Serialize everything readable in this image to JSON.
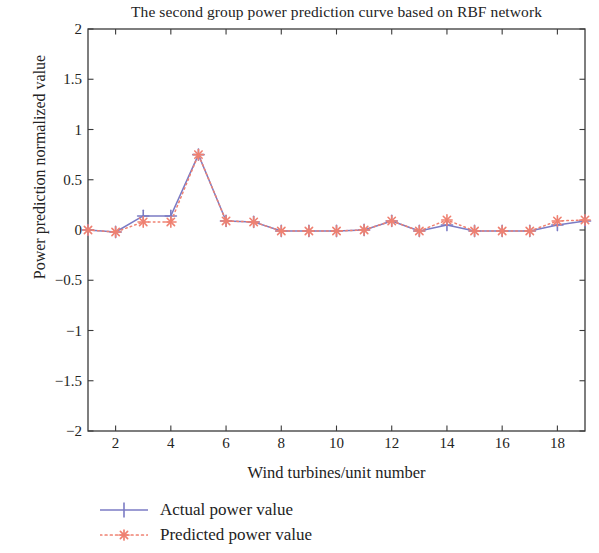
{
  "chart_data": {
    "type": "line",
    "title": "The second group power prediction curve based on RBF network",
    "xlabel": "Wind turbines/unit number",
    "ylabel": "Power prediction normalized value",
    "xlim": [
      1,
      19
    ],
    "ylim": [
      -2,
      2
    ],
    "xticks": [
      2,
      4,
      6,
      8,
      10,
      12,
      14,
      16,
      18
    ],
    "yticks": [
      -2,
      -1.5,
      -1,
      -0.5,
      0,
      0.5,
      1,
      1.5,
      2
    ],
    "ytick_labels": [
      "−2",
      "−1.5",
      "−1",
      "−0.5",
      "0",
      "0.5",
      "1",
      "1.5",
      "2"
    ],
    "xtick_labels": [
      "2",
      "4",
      "6",
      "8",
      "10",
      "12",
      "14",
      "16",
      "18"
    ],
    "grid": false,
    "legend_position": "below-axes-left",
    "x": [
      1,
      2,
      3,
      4,
      5,
      6,
      7,
      8,
      9,
      10,
      11,
      12,
      13,
      14,
      15,
      16,
      17,
      18,
      19
    ],
    "series": [
      {
        "name": "Actual power value",
        "color": "#7b7bc4",
        "linestyle": "solid",
        "marker": "plus",
        "values": [
          0.0,
          -0.02,
          0.14,
          0.14,
          0.75,
          0.09,
          0.08,
          -0.01,
          -0.01,
          -0.01,
          0.0,
          0.09,
          -0.01,
          0.05,
          -0.01,
          -0.01,
          -0.01,
          0.05,
          0.09
        ]
      },
      {
        "name": "Predicted power value",
        "color": "#ef8171",
        "linestyle": "dotted",
        "marker": "star",
        "values": [
          0.0,
          -0.02,
          0.08,
          0.08,
          0.75,
          0.09,
          0.08,
          -0.01,
          -0.01,
          -0.01,
          0.0,
          0.09,
          -0.01,
          0.1,
          -0.01,
          -0.01,
          -0.01,
          0.09,
          0.1
        ]
      }
    ]
  },
  "legend": {
    "items": [
      {
        "label": "Actual power value"
      },
      {
        "label": "Predicted power value"
      }
    ]
  },
  "colors": {
    "actual": "#7b7bc4",
    "predicted": "#ef8171",
    "axis": "#3a3a3a",
    "text": "#232323",
    "background": "#ffffff"
  }
}
